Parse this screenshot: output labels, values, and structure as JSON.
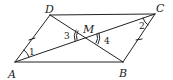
{
  "diagram": {
    "type": "geometry",
    "colors": {
      "stroke": "#222222",
      "text": "#1a1a1a",
      "background": "#ffffff"
    },
    "points": {
      "A": {
        "label": "A",
        "x": 15,
        "y": 62
      },
      "B": {
        "label": "B",
        "x": 123,
        "y": 62
      },
      "C": {
        "label": "C",
        "x": 155,
        "y": 14
      },
      "D": {
        "label": "D",
        "x": 50,
        "y": 15
      },
      "M": {
        "label": "M",
        "x": 87,
        "y": 37
      }
    },
    "segments": [
      "AB",
      "BC",
      "CD",
      "DA",
      "AC",
      "BD"
    ],
    "angles": {
      "a1": {
        "label": "1",
        "vertex": "A",
        "between": [
          "AD",
          "AC"
        ]
      },
      "a2": {
        "label": "2",
        "vertex": "C",
        "between": [
          "CA",
          "CB"
        ]
      },
      "a3": {
        "label": "3",
        "vertex": "M",
        "between": [
          "MD",
          "MA"
        ],
        "arcs": 2
      },
      "a4": {
        "label": "4",
        "vertex": "M",
        "between": [
          "MC",
          "MB"
        ],
        "arcs": 2
      }
    },
    "tick_marks": [
      {
        "segment": "AD",
        "count": 1
      },
      {
        "segment": "BC",
        "count": 1
      }
    ]
  }
}
